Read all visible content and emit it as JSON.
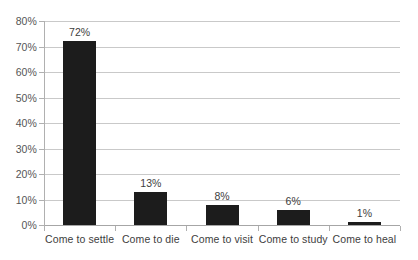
{
  "chart_data": {
    "type": "bar",
    "title": "",
    "subtitle": "",
    "xlabel": "",
    "ylabel": "",
    "categories": [
      "Come to settle",
      "Come to die",
      "Come to visit",
      "Come to study",
      "Come to heal"
    ],
    "values": [
      72,
      13,
      8,
      6,
      1
    ],
    "value_labels": [
      "72%",
      "13%",
      "8%",
      "6%",
      "1%"
    ],
    "ylim": [
      0,
      80
    ],
    "ytick_values": [
      80,
      70,
      60,
      50,
      40,
      30,
      20,
      10,
      0
    ],
    "ytick_labels": [
      "80%",
      "70%",
      "60%",
      "50%",
      "40%",
      "30%",
      "20%",
      "10%",
      "0%"
    ],
    "grid": true,
    "legend": false,
    "legend_position": "none",
    "bar_color": "#1c1c1c",
    "gridline_color": "#c9c9c9",
    "axis_color": "#b0b0b0",
    "background_color": "#ffffff"
  }
}
